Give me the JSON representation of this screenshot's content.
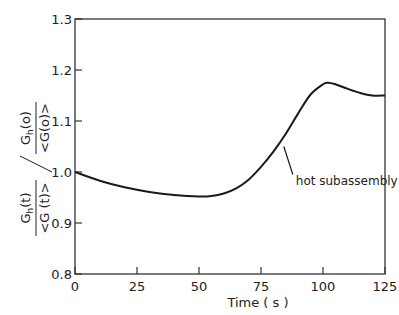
{
  "chart_data": {
    "type": "line",
    "title": "",
    "xlabel": "Time (s)",
    "ylabel_numerator": "G_h(t) / G_h(0)",
    "ylabel_denominator": "<G(t)> / <G(0)>",
    "xlim": [
      0,
      125
    ],
    "ylim": [
      0.8,
      1.3
    ],
    "xticks": [
      0,
      25,
      50,
      75,
      100,
      125
    ],
    "yticks": [
      0.8,
      0.9,
      1.0,
      1.1,
      1.2,
      1.3
    ],
    "xtick_labels": [
      "0",
      "25",
      "50",
      "75",
      "100",
      "125"
    ],
    "ytick_labels": [
      "0.8",
      "0.9",
      "1.0",
      "1.1",
      "1.2",
      "1.3"
    ],
    "grid": false,
    "series": [
      {
        "name": "hot subassembly",
        "x": [
          0,
          10,
          20,
          30,
          40,
          50,
          55,
          60,
          65,
          70,
          75,
          80,
          85,
          90,
          95,
          100,
          102,
          105,
          110,
          115,
          120,
          125
        ],
        "values": [
          1.0,
          0.983,
          0.97,
          0.961,
          0.955,
          0.952,
          0.953,
          0.958,
          0.968,
          0.985,
          1.01,
          1.04,
          1.075,
          1.115,
          1.152,
          1.172,
          1.175,
          1.172,
          1.163,
          1.155,
          1.15,
          1.15
        ]
      }
    ],
    "annotations": [
      {
        "text": "hot subassembly",
        "x": 85,
        "y": 1.05
      }
    ]
  },
  "labels": {
    "xlabel": "Time ( s )",
    "annotation": "hot subassembly",
    "y_num_top": "G",
    "y_num_sub": "h",
    "y_num_arg": "(t)",
    "y_num2_top": "G",
    "y_num2_sub": "h",
    "y_num2_arg": "(o)",
    "y_den": "<G (t)>",
    "y_den2": "<G(o)>"
  }
}
